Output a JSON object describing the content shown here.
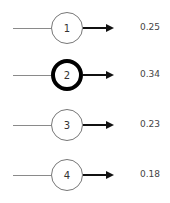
{
  "diagram": {
    "type": "output-layer",
    "nodes": [
      {
        "label": "1",
        "value": "0.25",
        "highlighted": false
      },
      {
        "label": "2",
        "value": "0.34",
        "highlighted": true
      },
      {
        "label": "3",
        "value": "0.23",
        "highlighted": false
      },
      {
        "label": "4",
        "value": "0.18",
        "highlighted": false
      }
    ],
    "colors": {
      "input_line": "#8a8a8a",
      "node_border": "#777777",
      "highlight_border": "#000000",
      "arrow": "#111111",
      "value_text": "#444444"
    }
  }
}
